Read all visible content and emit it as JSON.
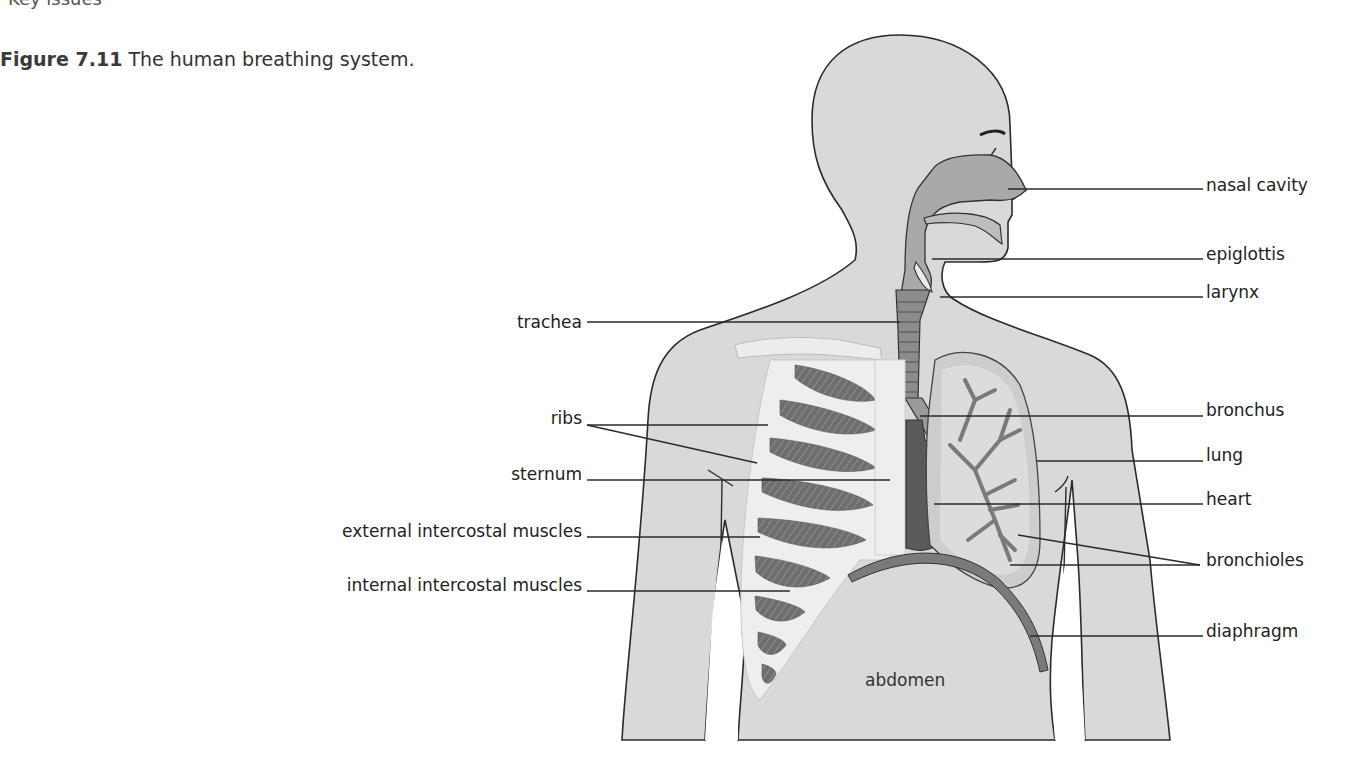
{
  "page": {
    "top_cut_text": "Key issues"
  },
  "figure": {
    "number": "Figure 7.11",
    "caption": "The human breathing system.",
    "colors": {
      "body_fill": "#d7d7d7",
      "outline": "#2b2b2b",
      "airway_fill": "#a9a9a9",
      "lung_fill": "#cfcfcf",
      "rib_fill": "#ececec",
      "muscle_fill": "#6f6f6f",
      "heart_fill": "#5a5a5a",
      "diaphragm_fill": "#7a7a7a"
    },
    "labels_left": [
      {
        "id": "trachea",
        "text": "trachea"
      },
      {
        "id": "ribs",
        "text": "ribs"
      },
      {
        "id": "sternum",
        "text": "sternum"
      },
      {
        "id": "external-intercostal-muscles",
        "text": "external intercostal muscles"
      },
      {
        "id": "internal-intercostal-muscles",
        "text": "internal intercostal muscles"
      }
    ],
    "labels_right": [
      {
        "id": "nasal-cavity",
        "text": "nasal cavity"
      },
      {
        "id": "epiglottis",
        "text": "epiglottis"
      },
      {
        "id": "larynx",
        "text": "larynx"
      },
      {
        "id": "bronchus",
        "text": "bronchus"
      },
      {
        "id": "lung",
        "text": "lung"
      },
      {
        "id": "heart",
        "text": "heart"
      },
      {
        "id": "bronchioles",
        "text": "bronchioles"
      },
      {
        "id": "diaphragm",
        "text": "diaphragm"
      }
    ],
    "label_inline": {
      "id": "abdomen",
      "text": "abdomen"
    }
  }
}
